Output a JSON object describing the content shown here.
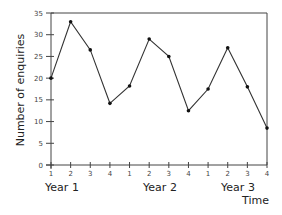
{
  "chart_data": {
    "type": "line",
    "title": "",
    "xlabel": "Time",
    "ylabel": "Number of enquiries",
    "ylim": [
      0,
      35
    ],
    "yticks": [
      0,
      5,
      10,
      15,
      20,
      25,
      30,
      35
    ],
    "x_tick_labels": [
      "1",
      "2",
      "3",
      "4",
      "1",
      "2",
      "3",
      "4",
      "1",
      "2",
      "3",
      "4"
    ],
    "group_labels": [
      "Year 1",
      "Year 2",
      "Year 3"
    ],
    "grid": false,
    "legend": null,
    "series": [
      {
        "name": "Number of enquiries",
        "x": [
          "Y1 Q1",
          "Y1 Q2",
          "Y1 Q3",
          "Y1 Q4",
          "Y2 Q1",
          "Y2 Q2",
          "Y2 Q3",
          "Y2 Q4",
          "Y3 Q1",
          "Y3 Q2",
          "Y3 Q3",
          "Y3 Q4"
        ],
        "values": [
          20,
          33,
          26.5,
          14.2,
          18.2,
          29,
          25,
          12.5,
          17.5,
          27,
          18,
          8.5
        ]
      }
    ]
  },
  "colors": {
    "line": "#333333",
    "axis": "#444444",
    "background": "#ffffff"
  }
}
